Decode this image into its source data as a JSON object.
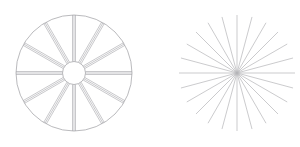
{
  "page": {
    "width": 300,
    "height": 147,
    "background_color": "#ffffff"
  },
  "chart_data": {
    "type": "diagram",
    "background": "#ffffff",
    "figure_count": 2,
    "figures": [
      {
        "id": "spoked-wheel",
        "name": "Spoked Wheel",
        "kind": "wheel",
        "center": {
          "x": 74,
          "y": 73
        },
        "rim": {
          "radius": 58,
          "stroke": "#a8a8ac",
          "stroke_width": 0.8,
          "visible": true
        },
        "hub": {
          "radius": 11.5,
          "stroke": "#a8a8ac",
          "stroke_width": 0.8,
          "fill": "none",
          "visible": true
        },
        "spokes": {
          "count": 12,
          "angle_step_deg": 30,
          "angle_offset_deg": -90,
          "inner_radius": 11.5,
          "outer_radius": 58,
          "bundle_lines": 3,
          "bundle_spacing": 1.5,
          "stroke": "#b0b0b4",
          "stroke_width": 0.7
        }
      },
      {
        "id": "starburst",
        "name": "Starburst",
        "kind": "starburst",
        "center": {
          "x": 237,
          "y": 73
        },
        "rim": {
          "radius": 0,
          "stroke": "none",
          "stroke_width": 0,
          "visible": false
        },
        "hub": {
          "radius": 0,
          "stroke": "none",
          "stroke_width": 0,
          "fill": "none",
          "visible": false
        },
        "spokes": {
          "count": 24,
          "angle_step_deg": 15,
          "angle_offset_deg": -90,
          "inner_radius": 0,
          "outer_radius": 58,
          "bundle_lines": 1,
          "bundle_spacing": 0,
          "stroke": "#b4b4b8",
          "stroke_width": 0.7
        }
      }
    ],
    "colors": {
      "line": "#b0b0b4",
      "outline": "#a8a8ac",
      "background": "#ffffff"
    },
    "xlabel": "",
    "ylabel": "",
    "legend": [],
    "annotations": [],
    "grid": false
  }
}
